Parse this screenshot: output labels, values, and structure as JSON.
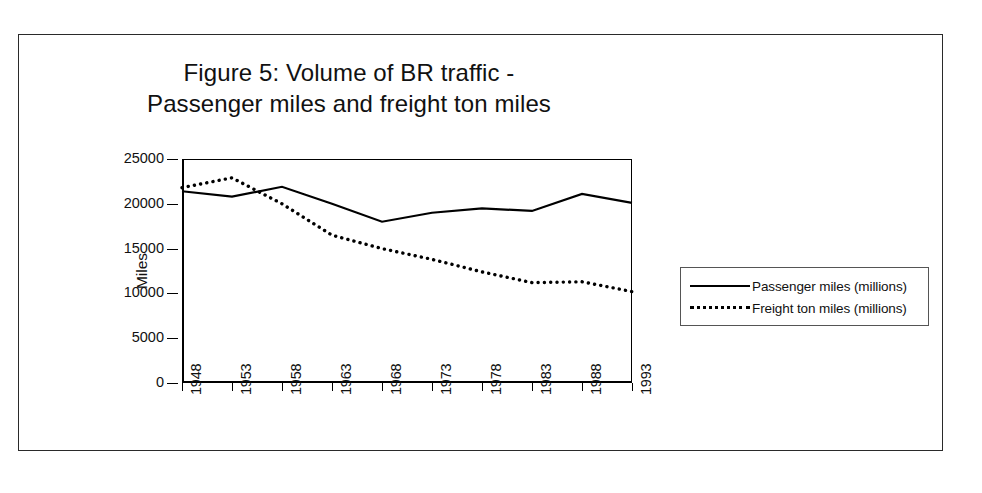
{
  "figure": {
    "title_line1": "Figure 5: Volume of BR traffic -",
    "title_line2": "Passenger miles and freight ton miles"
  },
  "chart_data": {
    "type": "line",
    "title": "Figure 5: Volume of BR traffic - Passenger miles and freight ton miles",
    "xlabel": "",
    "ylabel": "Miles",
    "x": [
      1948,
      1953,
      1958,
      1963,
      1968,
      1973,
      1978,
      1983,
      1988,
      1993
    ],
    "xtick_labels": [
      "1948",
      "1953",
      "1958",
      "1963",
      "1968",
      "1973",
      "1978",
      "1983",
      "1988",
      "1993"
    ],
    "ytick_labels": [
      "0",
      "5000",
      "10000",
      "15000",
      "20000",
      "25000"
    ],
    "ytick_values": [
      0,
      5000,
      10000,
      15000,
      20000,
      25000
    ],
    "ylim": [
      0,
      25000
    ],
    "xlim": [
      1948,
      1993
    ],
    "grid": false,
    "legend_position": "right-outside",
    "series": [
      {
        "name": "Passenger miles (millions)",
        "style": "solid",
        "color": "#000000",
        "values": [
          21400,
          20800,
          21900,
          20000,
          18000,
          19000,
          19500,
          19200,
          21100,
          20100
        ]
      },
      {
        "name": "Freight ton miles (millions)",
        "style": "dotted",
        "color": "#000000",
        "values": [
          21800,
          22900,
          20000,
          16500,
          15000,
          13800,
          12400,
          11200,
          11300,
          10200
        ]
      }
    ]
  },
  "legend": {
    "items": [
      {
        "label": "Passenger miles (millions)",
        "style": "solid"
      },
      {
        "label": "Freight ton miles (millions)",
        "style": "dotted"
      }
    ]
  }
}
